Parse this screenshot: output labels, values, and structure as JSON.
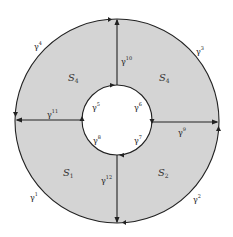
{
  "diagram": {
    "colors": {
      "fill": "#d4d4d4",
      "stroke": "#222222",
      "background": "#ffffff"
    },
    "outer_circle": {
      "cx": 117,
      "cy": 121,
      "r": 102
    },
    "inner_circle": {
      "cx": 117,
      "cy": 120,
      "r": 35
    },
    "regions": [
      {
        "name": "S",
        "sub": "4",
        "pos": "top-left",
        "x": 72,
        "y": 78
      },
      {
        "name": "S",
        "sub": "4",
        "pos": "top-right",
        "x": 163,
        "y": 78
      },
      {
        "name": "S",
        "sub": "1",
        "pos": "bottom-left",
        "x": 67,
        "y": 173
      },
      {
        "name": "S",
        "sub": "2",
        "pos": "bottom-right",
        "x": 162,
        "y": 173
      }
    ],
    "edges": [
      {
        "id": "g1",
        "sym": "γ",
        "sup": "1",
        "x": 30,
        "y": 198
      },
      {
        "id": "g2",
        "sym": "γ",
        "sup": "2",
        "x": 193,
        "y": 200
      },
      {
        "id": "g3",
        "sym": "γ",
        "sup": "3",
        "x": 196,
        "y": 52
      },
      {
        "id": "g4",
        "sym": "γ",
        "sup": "4",
        "x": 34,
        "y": 47
      },
      {
        "id": "g5",
        "sym": "γ",
        "sup": "5",
        "x": 92,
        "y": 108
      },
      {
        "id": "g6",
        "sym": "γ",
        "sup": "6",
        "x": 134,
        "y": 108
      },
      {
        "id": "g7",
        "sym": "γ",
        "sup": "7",
        "x": 134,
        "y": 141
      },
      {
        "id": "g8",
        "sym": "γ",
        "sup": "8",
        "x": 93,
        "y": 141
      },
      {
        "id": "g9",
        "sym": "γ",
        "sup": "9",
        "x": 178,
        "y": 133
      },
      {
        "id": "g10",
        "sym": "γ",
        "sup": "10",
        "x": 121,
        "y": 62
      },
      {
        "id": "g11",
        "sym": "γ",
        "sup": "11",
        "x": 47,
        "y": 115
      },
      {
        "id": "g12",
        "sym": "γ",
        "sup": "12",
        "x": 101,
        "y": 181
      }
    ]
  }
}
